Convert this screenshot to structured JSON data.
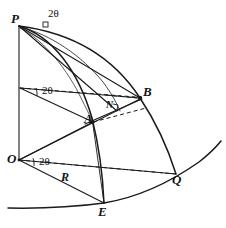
{
  "figure": {
    "kind": "geometry-diagram",
    "ink_color": "#1a1a1a",
    "background_color": "#ffffff",
    "stroke_width": 1.1,
    "dash_pattern": "4 3"
  },
  "labels": {
    "vertices": [
      {
        "name": "point-p",
        "text": "P",
        "x": 11,
        "y": 12
      },
      {
        "name": "point-o",
        "text": "O",
        "x": 7,
        "y": 152
      },
      {
        "name": "point-a",
        "text": "A",
        "x": 84,
        "y": 112
      },
      {
        "name": "point-n",
        "text": "N",
        "x": 107,
        "y": 101
      },
      {
        "name": "point-b",
        "text": "B",
        "x": 144,
        "y": 86
      },
      {
        "name": "point-e",
        "text": "E",
        "x": 98,
        "y": 205
      },
      {
        "name": "point-q",
        "text": "Q",
        "x": 172,
        "y": 173
      }
    ],
    "angles": [
      {
        "name": "angle-top",
        "text": "2θ",
        "x": 48,
        "y": 9
      },
      {
        "name": "angle-middle",
        "text": "2θ",
        "x": 42,
        "y": 85
      },
      {
        "name": "angle-bottom",
        "text": "2θ",
        "x": 39,
        "y": 156
      }
    ],
    "measures": [
      {
        "name": "radius-r",
        "text": "R",
        "x": 61,
        "y": 172
      }
    ]
  },
  "geometry": {
    "points": {
      "P": {
        "x": 19,
        "y": 25
      },
      "M": {
        "x": 20,
        "y": 88
      },
      "O": {
        "x": 19,
        "y": 160
      },
      "A": {
        "x": 93,
        "y": 122
      },
      "N": {
        "x": 117,
        "y": 111
      },
      "B": {
        "x": 140,
        "y": 98
      },
      "E": {
        "x": 104,
        "y": 203
      },
      "Q": {
        "x": 176,
        "y": 174
      },
      "C1": {
        "x": 101,
        "y": 119
      },
      "C2": {
        "x": 112,
        "y": 107
      }
    },
    "solid_lines": [
      {
        "name": "axis-p-o",
        "from": "P",
        "to": "O"
      },
      {
        "name": "line-o-e",
        "from": "O",
        "to": "E"
      },
      {
        "name": "line-o-q",
        "from": "O",
        "to": "Q"
      },
      {
        "name": "line-o-a",
        "from": "O",
        "to": "A"
      },
      {
        "name": "line-o-b",
        "from": "O",
        "to": "B"
      },
      {
        "name": "line-m-a",
        "from": "M",
        "to": "A"
      },
      {
        "name": "line-m-b",
        "from": "M",
        "to": "B"
      },
      {
        "name": "line-a-b",
        "from": "A",
        "to": "B"
      },
      {
        "name": "line-p-b",
        "from": "P",
        "to": "B"
      },
      {
        "name": "line-p-n",
        "from": "P",
        "to": "N"
      }
    ],
    "dashed_lines": [
      {
        "name": "dash-m-horizontal",
        "x1": 20,
        "y1": 88,
        "x2": 134,
        "y2": 98
      },
      {
        "name": "dash-a-horizontal",
        "x1": 93,
        "y1": 122,
        "x2": 143,
        "y2": 110
      },
      {
        "name": "dash-o-horizontal",
        "x1": 19,
        "y1": 160,
        "x2": 176,
        "y2": 174
      },
      {
        "name": "dash-n-short",
        "x1": 108,
        "y1": 96,
        "x2": 138,
        "y2": 99
      }
    ],
    "arcs": [
      {
        "name": "arc-p-e-outer",
        "path": "M 19 25 Q 78 52 104 203"
      },
      {
        "name": "arc-p-q-outer",
        "path": "M 19 25 Q 120 48 176 174"
      },
      {
        "name": "arc-p-n-inner",
        "path": "M 19 25 Q 84 50 120 110"
      },
      {
        "name": "arc-base-ground",
        "path": "M 10 208 Q 110 208 220 140"
      }
    ],
    "right_angle_marks": [
      {
        "name": "right-angle-n",
        "x": 116,
        "y": 104,
        "size": 5,
        "rotation": -18
      },
      {
        "name": "right-angle-p",
        "x": 40,
        "y": 26,
        "size": 5,
        "rotation": 10
      }
    ]
  }
}
